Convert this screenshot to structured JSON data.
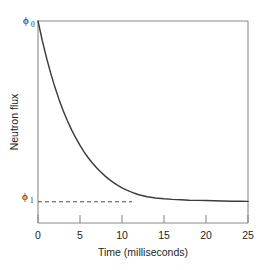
{
  "chart_data": {
    "type": "line",
    "title": "",
    "xlabel": "Time (milliseconds)",
    "ylabel": "Neutron flux",
    "xlim": [
      0,
      25
    ],
    "ylim": [
      0,
      1
    ],
    "grid": false,
    "legend": "none",
    "xticks": [
      0,
      5,
      10,
      15,
      20,
      25
    ],
    "xticklabels": [
      "0",
      "5",
      "10",
      "15",
      "20",
      "25"
    ],
    "yticks": [],
    "yticklabels": [],
    "y_level_labels": [
      {
        "name": "phi0",
        "display": "ϕ",
        "subscript": "0",
        "value": 1.0
      },
      {
        "name": "phi1",
        "display": "ϕ",
        "subscript": "1",
        "value": 0.105
      }
    ],
    "annotations": [
      {
        "name": "asymptote-dashed-line",
        "type": "dashed-horizontal",
        "y_value": 0.105,
        "x_from": 0,
        "x_to": 11.2
      }
    ],
    "series": [
      {
        "name": "neutron-flux-decay",
        "style": "solid",
        "color": "#3b3b3b",
        "description": "Exponential decay from phi0 to phi1",
        "x": [
          0,
          0.5,
          1,
          1.5,
          2,
          2.5,
          3,
          3.5,
          4,
          4.5,
          5,
          5.5,
          6,
          6.5,
          7,
          7.5,
          8,
          8.5,
          9,
          9.5,
          10,
          10.5,
          11,
          11.5,
          12,
          13,
          14,
          15,
          16,
          17,
          18,
          19,
          20,
          21,
          22,
          23,
          24,
          25
        ],
        "y": [
          1.0,
          0.905,
          0.82,
          0.743,
          0.674,
          0.612,
          0.556,
          0.506,
          0.461,
          0.421,
          0.384,
          0.351,
          0.322,
          0.296,
          0.272,
          0.251,
          0.232,
          0.215,
          0.2,
          0.186,
          0.174,
          0.164,
          0.155,
          0.147,
          0.14,
          0.13,
          0.124,
          0.12,
          0.117,
          0.115,
          0.113,
          0.112,
          0.111,
          0.11,
          0.109,
          0.108,
          0.108,
          0.107
        ]
      }
    ]
  },
  "figure": {
    "background_color": "#ffffff",
    "axis_color": "#8a8a8a",
    "curve_color": "#3b3b3b",
    "text_color": "#231f20"
  }
}
